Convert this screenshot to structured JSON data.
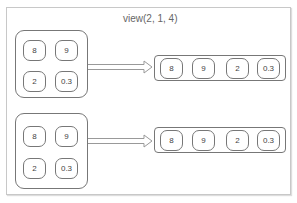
{
  "title": "view(2, 1, 4)",
  "groups": [
    {
      "grid": [
        "8",
        "9",
        "2",
        "0.3"
      ],
      "row": [
        "8",
        "9",
        "2",
        "0.3"
      ]
    },
    {
      "grid": [
        "8",
        "9",
        "2",
        "0.3"
      ],
      "row": [
        "8",
        "9",
        "2",
        "0.3"
      ]
    }
  ],
  "colors": {
    "stroke": "#777777",
    "frame": "#c8c8c8",
    "text": "#444444"
  }
}
